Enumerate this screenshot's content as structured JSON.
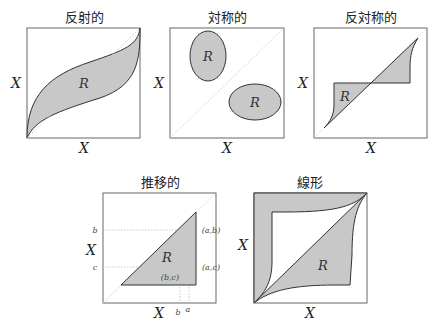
{
  "panels": [
    {
      "id": "reflexive",
      "title": "反射的",
      "x_label": "X",
      "y_label": "X",
      "region_label": "R"
    },
    {
      "id": "symmetric",
      "title": "対称的",
      "x_label": "X",
      "y_label": "X",
      "region_labels": [
        "R",
        "R"
      ]
    },
    {
      "id": "antisymmetric",
      "title": "反対称的",
      "x_label": "X",
      "y_label": "X",
      "region_label": "R"
    },
    {
      "id": "transitive",
      "title": "推移的",
      "x_label": "X",
      "y_label": "X",
      "region_label": "R",
      "y_ticks": [
        "b",
        "c"
      ],
      "x_ticks": [
        "b",
        "a"
      ],
      "points": [
        "(a,b)",
        "(a,c)",
        "(b,c)"
      ]
    },
    {
      "id": "linear",
      "title": "線形",
      "x_label": "X",
      "y_label": "X",
      "region_label": "R"
    }
  ],
  "colors": {
    "region_fill": "#c8c8c8",
    "outline": "#333333",
    "box": "#666666",
    "diagonal": "#cccccc"
  }
}
